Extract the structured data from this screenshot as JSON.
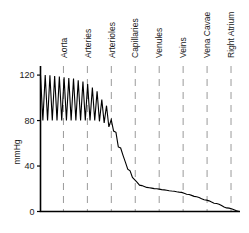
{
  "chart_data": {
    "type": "line",
    "title": "",
    "subtitle": "",
    "xlabel": "",
    "ylabel": "mmHg",
    "ylim": [
      0,
      128
    ],
    "xlim": [
      0,
      100
    ],
    "grid": "vertical-dashed",
    "legend": "none",
    "y_ticks": [
      "0",
      "40",
      "80",
      "120"
    ],
    "y_tick_values": [
      0,
      40,
      80,
      120
    ],
    "categories": [
      "Aorta",
      "Arteries",
      "Arterioles",
      "Capillaries",
      "Venules",
      "Veins",
      "Vena Cavae",
      "Right Atrium"
    ],
    "category_positions": [
      11.5,
      23.5,
      35.5,
      47.5,
      59.5,
      71.5,
      83.5,
      95.5
    ],
    "series": [
      {
        "name": "Blood pressure",
        "description": "Systemic blood pressure profile: pulsatile 120/80 in aorta, damping oscillation through arteries and arterioles, steep fall to about 20 mmHg at capillaries, gradual decline to 0 at the right atrium.",
        "envelope_systolic": [
          120,
          120,
          119,
          118,
          117,
          115,
          112,
          106,
          96,
          80,
          56,
          38,
          28,
          23,
          21,
          20,
          19,
          18,
          17,
          15,
          13,
          10,
          7,
          3,
          0
        ],
        "envelope_diastolic": [
          80,
          80,
          80,
          80,
          80,
          80,
          80,
          80,
          78,
          72,
          54,
          37,
          28,
          23,
          21,
          20,
          19,
          18,
          17,
          15,
          13,
          10,
          7,
          3,
          0
        ],
        "mean_values": [
          100,
          100,
          99,
          99,
          98,
          97,
          96,
          93,
          87,
          76,
          55,
          37,
          28,
          23,
          21,
          20,
          19,
          18,
          17,
          15,
          13,
          10,
          7,
          3,
          0
        ],
        "x_values": [
          0,
          4,
          8,
          12,
          16,
          20,
          24,
          28,
          32,
          36,
          40,
          44,
          47,
          50,
          54,
          58,
          62,
          66,
          70,
          74,
          78,
          83,
          88,
          94,
          100
        ]
      }
    ]
  },
  "colors": {
    "background": "#ffffff",
    "axis": "#000000",
    "gridline": "#9a9a9a",
    "curve": "#000000",
    "text": "#1a1a1a"
  }
}
